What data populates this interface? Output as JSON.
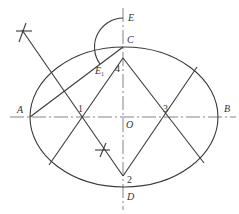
{
  "diagram": {
    "stroke_color": "#3a3a3a",
    "labels": {
      "A": "A",
      "B": "B",
      "C": "C",
      "D": "D",
      "E": "E",
      "O": "O",
      "E1_main": "E",
      "E1_sub": "1",
      "p1": "1",
      "p2": "2",
      "p3": "3",
      "p4": "4"
    },
    "points": {
      "A": [
        30,
        117
      ],
      "B": [
        218,
        117
      ],
      "C": [
        123,
        47
      ],
      "D": [
        123,
        187
      ],
      "O": [
        123,
        117
      ],
      "E": [
        123,
        18
      ],
      "E1": [
        100,
        64
      ],
      "p1": [
        82,
        117
      ],
      "p2": [
        123,
        176
      ],
      "p3": [
        164,
        117
      ],
      "p4": [
        123,
        58
      ]
    }
  }
}
